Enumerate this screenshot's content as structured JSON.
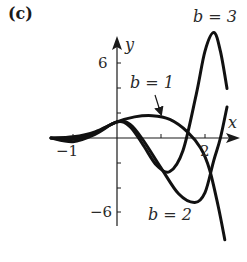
{
  "panel_label": "(c)",
  "chart_data": {
    "type": "line",
    "title": "",
    "xlabel": "x",
    "ylabel": "y",
    "xlim": [
      -1.5,
      2.6
    ],
    "ylim": [
      -9,
      9
    ],
    "grid": false,
    "x_ticks": [
      -1,
      1,
      2
    ],
    "x_tick_labels": [
      "−1",
      "2"
    ],
    "y_ticks": [
      -6,
      -4,
      -2,
      2,
      4,
      6
    ],
    "y_tick_labels": [
      "6",
      "−6"
    ],
    "series": [
      {
        "name": "b = 1",
        "x": [
          -1.5,
          -1.0,
          -0.5,
          0.0,
          0.4,
          0.8,
          1.2,
          1.6,
          1.9,
          2.1,
          2.3,
          2.45
        ],
        "y": [
          0.0,
          0.1,
          0.5,
          1.3,
          1.7,
          1.8,
          1.5,
          0.5,
          -0.8,
          -2.5,
          -5.5,
          -8.2
        ]
      },
      {
        "name": "b = 2",
        "x": [
          -1.5,
          -1.0,
          -0.5,
          0.0,
          0.3,
          0.6,
          1.0,
          1.4,
          1.77,
          2.0,
          2.2,
          2.35,
          2.5
        ],
        "y": [
          0.0,
          -0.1,
          0.4,
          1.3,
          1.1,
          -0.2,
          -2.4,
          -4.5,
          -5.2,
          -4.4,
          -1.8,
          0.0,
          2.5
        ]
      },
      {
        "name": "b = 3",
        "x": [
          -1.5,
          -1.0,
          -0.5,
          0.0,
          0.3,
          0.6,
          0.9,
          1.2,
          1.5,
          1.8,
          2.0,
          2.2,
          2.35,
          2.5
        ],
        "y": [
          0.0,
          -0.3,
          0.3,
          1.3,
          0.9,
          -0.6,
          -2.2,
          -2.7,
          -1.0,
          3.5,
          7.0,
          8.5,
          7.0,
          4.0
        ]
      }
    ],
    "annotations": [
      {
        "text": "b = 3",
        "position": "top-right"
      },
      {
        "text": "b = 1",
        "arrow_to": [
          0.85,
          1.8
        ]
      },
      {
        "text": "b = 2",
        "position": "bottom"
      }
    ]
  },
  "labels": {
    "x_axis": "x",
    "y_axis": "y",
    "tick_neg1": "−1",
    "tick_2": "2",
    "tick_6": "6",
    "tick_neg6": "−6",
    "b1": "b = 1",
    "b2": "b = 2",
    "b3": "b = 3"
  }
}
